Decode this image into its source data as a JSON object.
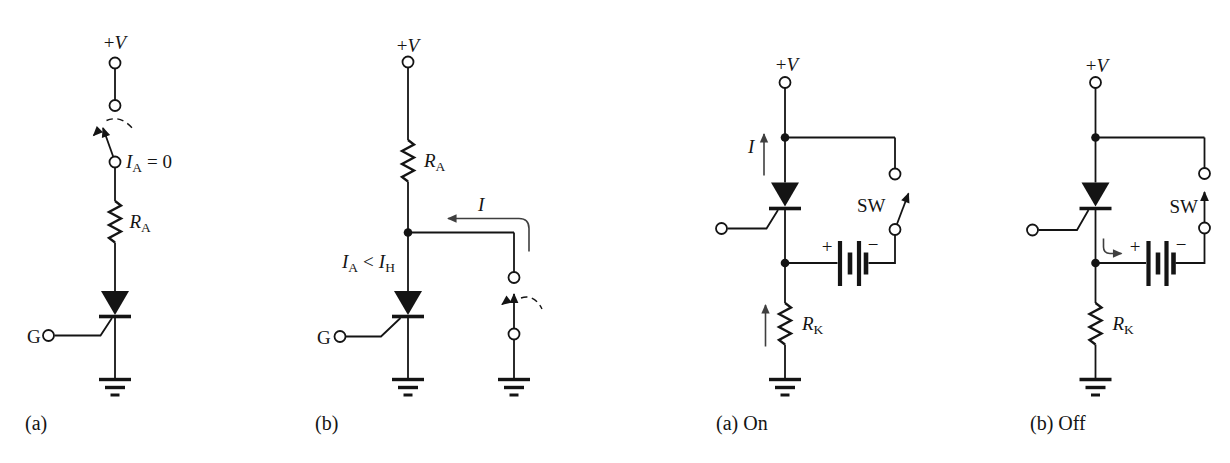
{
  "canvas": {
    "background": "#ffffff",
    "ink": "#141414",
    "current_arrow_color": "#3f3f3f"
  },
  "circuits": [
    {
      "caption": "(a)",
      "labels": {
        "supply": {
          "plus": "+",
          "v": "V"
        },
        "anode_current": {
          "sym": "I",
          "sub": "A",
          "eq": "= 0"
        },
        "resistor": {
          "sym": "R",
          "sub": "A"
        },
        "gate": "G"
      }
    },
    {
      "caption": "(b)",
      "labels": {
        "supply": {
          "plus": "+",
          "v": "V"
        },
        "resistor": {
          "sym": "R",
          "sub": "A"
        },
        "loop_current": "I",
        "condition": {
          "sym1": "I",
          "sub1": "A",
          "lt": "<",
          "sym2": "I",
          "sub2": "H"
        },
        "gate": "G"
      }
    },
    {
      "caption": "(a) On",
      "labels": {
        "supply": {
          "plus": "+",
          "v": "V"
        },
        "current": "I",
        "switch": "SW",
        "battery_plus": "+",
        "battery_minus": "−",
        "resistor": {
          "sym": "R",
          "sub": "K"
        }
      }
    },
    {
      "caption": "(b) Off",
      "labels": {
        "supply": {
          "plus": "+",
          "v": "V"
        },
        "switch": "SW",
        "battery_plus": "+",
        "battery_minus": "−",
        "resistor": {
          "sym": "R",
          "sub": "K"
        }
      }
    }
  ]
}
